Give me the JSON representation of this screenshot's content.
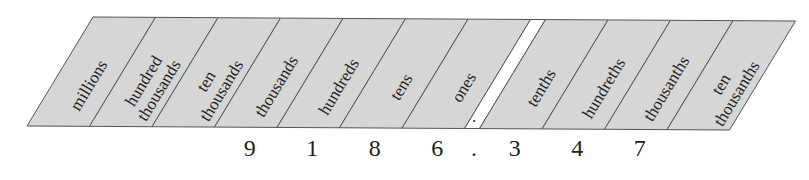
{
  "diagram": {
    "title": "",
    "colors": {
      "cell_fill": "#d6d6d6",
      "decimal_fill": "#ffffff",
      "stroke": "#555555",
      "text": "#222222"
    },
    "places": [
      {
        "lines": [
          "millions"
        ],
        "digit": ""
      },
      {
        "lines": [
          "hundred",
          "thousands"
        ],
        "digit": ""
      },
      {
        "lines": [
          "ten",
          "thousands"
        ],
        "digit": ""
      },
      {
        "lines": [
          "thousands"
        ],
        "digit": "9"
      },
      {
        "lines": [
          "hundreds"
        ],
        "digit": "1"
      },
      {
        "lines": [
          "tens"
        ],
        "digit": "8"
      },
      {
        "lines": [
          "ones"
        ],
        "digit": "6"
      },
      {
        "decimal": true,
        "mark": ".",
        "digit": "."
      },
      {
        "lines": [
          "tenths"
        ],
        "digit": "3"
      },
      {
        "lines": [
          "hundreths"
        ],
        "digit": "4"
      },
      {
        "lines": [
          "thousanths"
        ],
        "digit": "7"
      },
      {
        "lines": [
          "ten",
          "thousanths"
        ],
        "digit": ""
      }
    ],
    "number": "9186.347"
  }
}
